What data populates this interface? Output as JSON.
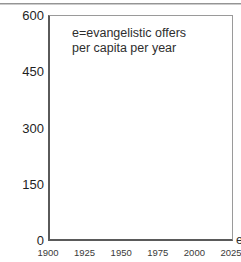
{
  "chart_data": {
    "type": "line",
    "title": "",
    "subtitle": "",
    "xlabel": "",
    "ylabel": "",
    "xlim": [
      1900,
      2025
    ],
    "ylim": [
      0,
      600
    ],
    "grid": false,
    "legend_position": "none",
    "xticks": [
      "1900",
      "1925",
      "1950",
      "1975",
      "2000",
      "2025"
    ],
    "xtick_values": [
      1900,
      1925,
      1950,
      1975,
      2000,
      2025
    ],
    "yticks": [
      "0",
      "150",
      "300",
      "450",
      "600"
    ],
    "ytick_values": [
      0,
      150,
      300,
      450,
      600
    ],
    "series": [],
    "annotations": [
      {
        "name": "legend-note",
        "lines": [
          "e=evangelistic offers",
          "per capita per year"
        ],
        "x": 1915,
        "y": 560
      },
      {
        "name": "clipped-series-label",
        "lines": [
          "e"
        ],
        "x": 2025,
        "y": 10
      }
    ]
  },
  "annotation": {
    "line1": "e=evangelistic offers",
    "line2": "per capita per year"
  },
  "edge_label": {
    "text": "e"
  },
  "colors": {
    "background": "#ffffff",
    "axis": "#5a5a5a",
    "frame": "#9a9a9a",
    "text": "#1f1f1f",
    "tick_text": "#3a3a3a",
    "scan_rule": "#8f8f8f"
  }
}
